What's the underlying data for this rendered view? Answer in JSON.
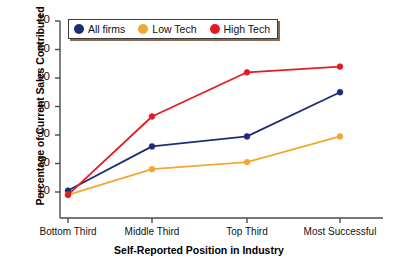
{
  "chart_data": {
    "type": "line",
    "title": "",
    "subtitle": "",
    "xlabel": "Self-Reported Position in Industry",
    "ylabel": "Percentage of Current Sales Contributed",
    "categories": [
      "Bottom Third",
      "Middle Third",
      "Top Third",
      "Most Successful"
    ],
    "ylim": [
      5,
      70
    ],
    "yticks": [
      10,
      20,
      30,
      40,
      50,
      60,
      70
    ],
    "ytick_labels": [
      "10",
      "20",
      "30",
      "40",
      "50",
      "60",
      "70"
    ],
    "grid": false,
    "legend_position": "top-left",
    "series": [
      {
        "name": "All firms",
        "color": "#1F2C7A",
        "marker": "circle",
        "values": [
          10.5,
          26.0,
          29.5,
          45.0
        ]
      },
      {
        "name": "Low Tech",
        "color": "#F0A830",
        "marker": "circle",
        "values": [
          9.0,
          18.0,
          20.5,
          29.5
        ]
      },
      {
        "name": "High Tech",
        "color": "#E31C23",
        "marker": "circle",
        "values": [
          9.0,
          36.5,
          52.0,
          54.0
        ]
      }
    ],
    "axis_color": "#4a4a4a"
  }
}
